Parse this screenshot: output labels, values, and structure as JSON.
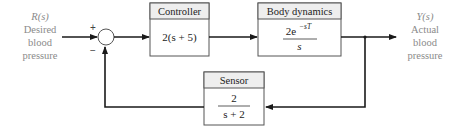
{
  "diagram": {
    "type": "feedback-control-block-diagram",
    "input": {
      "symbol": "R(s)",
      "lines": [
        "Desired",
        "blood",
        "pressure"
      ]
    },
    "output": {
      "symbol": "Y(s)",
      "lines": [
        "Actual",
        "blood",
        "pressure"
      ]
    },
    "summing_junction": {
      "plus_sign": "+",
      "minus_sign": "−"
    },
    "blocks": [
      {
        "id": "controller",
        "title": "Controller",
        "transfer_function": "2(s + 5)"
      },
      {
        "id": "body-dynamics",
        "title": "Body dynamics",
        "numerator": "2e",
        "numerator_exponent": "−sT",
        "denominator": "s"
      },
      {
        "id": "sensor",
        "title": "Sensor",
        "numerator": "2",
        "denominator": "s + 2"
      }
    ],
    "colors": {
      "line": "#1a1a1a",
      "box_border": "#555555",
      "header_fill": "#eeeeee",
      "label_gray": "#8a8a8a"
    }
  }
}
